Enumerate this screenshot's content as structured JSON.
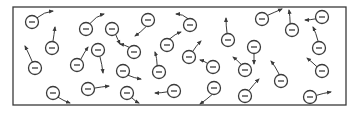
{
  "diagram": {
    "colors": {
      "stroke": "#3a3a3a",
      "fill": "#ffffff",
      "background": "#ffffff"
    },
    "box": {
      "x": 13,
      "y": 7,
      "width": 333,
      "height": 98
    },
    "electron": {
      "radius": 6.5,
      "symbol": "minus-sign"
    },
    "electrons": [
      {
        "cx": 32,
        "cy": 22,
        "arrow": [
          [
            38,
            17
          ],
          [
            44,
            12
          ],
          [
            53,
            11
          ]
        ]
      },
      {
        "cx": 52,
        "cy": 48,
        "arrow": [
          [
            53,
            41
          ],
          [
            54,
            35
          ],
          [
            55,
            27
          ]
        ]
      },
      {
        "cx": 35,
        "cy": 68,
        "arrow": [
          [
            32,
            61
          ],
          [
            29,
            54
          ],
          [
            25,
            46
          ]
        ]
      },
      {
        "cx": 86,
        "cy": 29,
        "arrow": [
          [
            91,
            22
          ],
          [
            96,
            16
          ],
          [
            104,
            14
          ]
        ]
      },
      {
        "cx": 112,
        "cy": 29,
        "arrow": [
          [
            116,
            35
          ],
          [
            118,
            40
          ],
          [
            120,
            44
          ]
        ]
      },
      {
        "cx": 77,
        "cy": 65,
        "arrow": [
          [
            81,
            59
          ],
          [
            84,
            53
          ],
          [
            88,
            47
          ]
        ]
      },
      {
        "cx": 98,
        "cy": 50,
        "arrow": [
          [
            100,
            57
          ],
          [
            102,
            64
          ],
          [
            103,
            73
          ]
        ]
      },
      {
        "cx": 53,
        "cy": 93,
        "arrow": [
          [
            59,
            98
          ],
          [
            64,
            101
          ],
          [
            70,
            103
          ]
        ]
      },
      {
        "cx": 88,
        "cy": 89,
        "arrow": [
          [
            95,
            88
          ],
          [
            101,
            87
          ],
          [
            109,
            86
          ]
        ]
      },
      {
        "cx": 148,
        "cy": 20,
        "arrow": [
          [
            146,
            28
          ],
          [
            141,
            32
          ],
          [
            135,
            36
          ]
        ]
      },
      {
        "cx": 190,
        "cy": 25,
        "arrow": [
          [
            188,
            18
          ],
          [
            183,
            14
          ],
          [
            176,
            14
          ]
        ]
      },
      {
        "cx": 134,
        "cy": 52,
        "arrow": [
          [
            129,
            47
          ],
          [
            125,
            45
          ],
          [
            120,
            44
          ]
        ]
      },
      {
        "cx": 167,
        "cy": 45,
        "arrow": [
          [
            170,
            38
          ],
          [
            175,
            34
          ],
          [
            181,
            32
          ]
        ]
      },
      {
        "cx": 189,
        "cy": 57,
        "arrow": [
          [
            193,
            51
          ],
          [
            196,
            46
          ],
          [
            201,
            41
          ]
        ]
      },
      {
        "cx": 123,
        "cy": 71,
        "arrow": [
          [
            129,
            76
          ],
          [
            134,
            78
          ],
          [
            141,
            79
          ]
        ]
      },
      {
        "cx": 159,
        "cy": 72,
        "arrow": [
          [
            157,
            65
          ],
          [
            157,
            58
          ],
          [
            155,
            52
          ]
        ]
      },
      {
        "cx": 213,
        "cy": 67,
        "arrow": [
          [
            207,
            63
          ],
          [
            204,
            61
          ],
          [
            200,
            60
          ]
        ]
      },
      {
        "cx": 127,
        "cy": 93,
        "arrow": [
          [
            132,
            98
          ],
          [
            135,
            101
          ],
          [
            139,
            103
          ]
        ]
      },
      {
        "cx": 174,
        "cy": 91,
        "arrow": [
          [
            166,
            92
          ],
          [
            161,
            93
          ],
          [
            155,
            93
          ]
        ]
      },
      {
        "cx": 214,
        "cy": 88,
        "arrow": [
          [
            212,
            96
          ],
          [
            206,
            100
          ],
          [
            200,
            104
          ]
        ]
      },
      {
        "cx": 228,
        "cy": 40,
        "arrow": [
          [
            227,
            33
          ],
          [
            226,
            26
          ],
          [
            226,
            18
          ]
        ]
      },
      {
        "cx": 262,
        "cy": 19,
        "arrow": [
          [
            268,
            15
          ],
          [
            275,
            12
          ],
          [
            282,
            9
          ]
        ]
      },
      {
        "cx": 292,
        "cy": 30,
        "arrow": [
          [
            290,
            23
          ],
          [
            290,
            16
          ],
          [
            289,
            10
          ]
        ]
      },
      {
        "cx": 322,
        "cy": 17,
        "arrow": [
          [
            315,
            19
          ],
          [
            310,
            20
          ],
          [
            305,
            20
          ]
        ]
      },
      {
        "cx": 319,
        "cy": 48,
        "arrow": [
          [
            318,
            40
          ],
          [
            316,
            33
          ],
          [
            313,
            27
          ]
        ]
      },
      {
        "cx": 254,
        "cy": 47,
        "arrow": [
          [
            254,
            54
          ],
          [
            254,
            59
          ],
          [
            254,
            64
          ]
        ]
      },
      {
        "cx": 245,
        "cy": 70,
        "arrow": [
          [
            241,
            64
          ],
          [
            237,
            60
          ],
          [
            233,
            57
          ]
        ]
      },
      {
        "cx": 281,
        "cy": 81,
        "arrow": [
          [
            279,
            73
          ],
          [
            275,
            66
          ],
          [
            271,
            61
          ]
        ]
      },
      {
        "cx": 322,
        "cy": 71,
        "arrow": [
          [
            316,
            66
          ],
          [
            312,
            62
          ],
          [
            307,
            58
          ]
        ]
      },
      {
        "cx": 245,
        "cy": 96,
        "arrow": [
          [
            250,
            89
          ],
          [
            254,
            84
          ],
          [
            259,
            79
          ]
        ]
      },
      {
        "cx": 310,
        "cy": 97,
        "arrow": [
          [
            318,
            95
          ],
          [
            324,
            93
          ],
          [
            331,
            92
          ]
        ]
      }
    ]
  }
}
